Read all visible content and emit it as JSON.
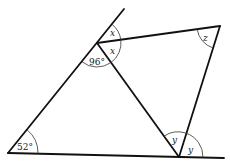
{
  "diagram": {
    "points": {
      "A": {
        "x": 8,
        "y": 153
      },
      "B": {
        "x": 97,
        "y": 43
      },
      "B_ext": {
        "x": 124,
        "y": 9
      },
      "C": {
        "x": 220,
        "y": 26
      },
      "D": {
        "x": 179,
        "y": 157
      },
      "D_ext": {
        "x": 224,
        "y": 158
      }
    },
    "angles": {
      "a_bottom_left": "52°",
      "b_obtuse": "96°",
      "x_upper": "x",
      "x_lower": "x",
      "z_top_right": "z",
      "y_left": "y",
      "y_right": "y"
    },
    "colors": {
      "line": "#111111",
      "arc": "#333333",
      "text": "#222222",
      "background": "#ffffff"
    }
  }
}
